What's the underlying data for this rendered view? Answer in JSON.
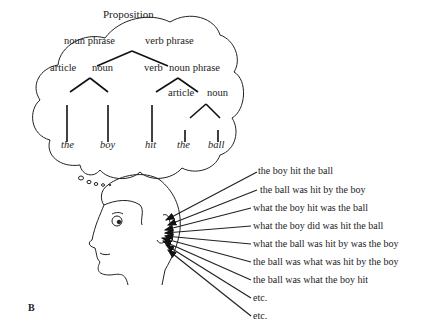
{
  "tree": {
    "root": "Proposition",
    "noun_phrase": "noun phrase",
    "verb_phrase": "verb phrase",
    "article1": "article",
    "noun1": "noun",
    "verb": "verb",
    "noun_phrase2": "noun phrase",
    "article2": "article",
    "noun2": "noun",
    "words": [
      "the",
      "boy",
      "hit",
      "the",
      "ball"
    ]
  },
  "sentences": [
    "the boy hit the ball",
    "the ball was hit by the boy",
    "what the boy hit was the ball",
    "what the boy did was hit the ball",
    "what the ball was hit by was the boy",
    "the ball was what was hit by the boy",
    "the ball was what the boy hit",
    "etc.",
    "etc."
  ],
  "panel_label": "B"
}
